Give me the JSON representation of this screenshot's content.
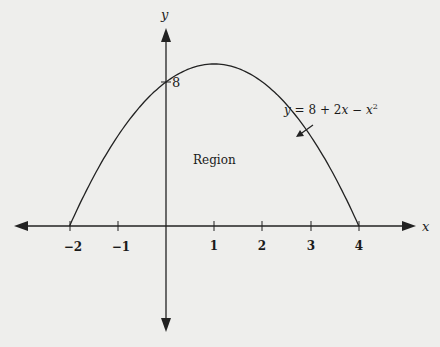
{
  "chart_data": {
    "type": "line",
    "title": "",
    "equation_label": "y = 8 + 2x − x²",
    "xlabel": "x",
    "ylabel": "y",
    "x_ticks": [
      -2,
      -1,
      1,
      2,
      3,
      4
    ],
    "x_tick_labels": [
      "−2",
      "−1",
      "1",
      "2",
      "3",
      "4"
    ],
    "y_ticks": [
      8
    ],
    "y_tick_labels": [
      "8"
    ],
    "xlim": [
      -3.3,
      5.2
    ],
    "ylim": [
      -7.5,
      10.5
    ],
    "series": [
      {
        "name": "y = 8 + 2x − x²",
        "x": [
          -2,
          -1,
          0,
          1,
          2,
          3,
          4
        ],
        "y": [
          0,
          5,
          8,
          9,
          8,
          5,
          0
        ]
      }
    ],
    "annotations": [
      {
        "text": "Region",
        "x": 1,
        "y": 4
      },
      {
        "text": "y = 8 + 2x − x²",
        "arrow_to": [
          2.7,
          3.9
        ]
      }
    ],
    "grid": false,
    "legend": "none"
  },
  "labels": {
    "x_axis": "x",
    "y_axis": "y",
    "y_tick_8": "8",
    "region": "Region",
    "eq_y": "y",
    "eq_mid": " = 8 + 2",
    "eq_x1": "x",
    "eq_minus": " − ",
    "eq_x2": "x",
    "eq_exp": "2",
    "ticks": [
      "−2",
      "−1",
      "1",
      "2",
      "3",
      "4"
    ]
  }
}
